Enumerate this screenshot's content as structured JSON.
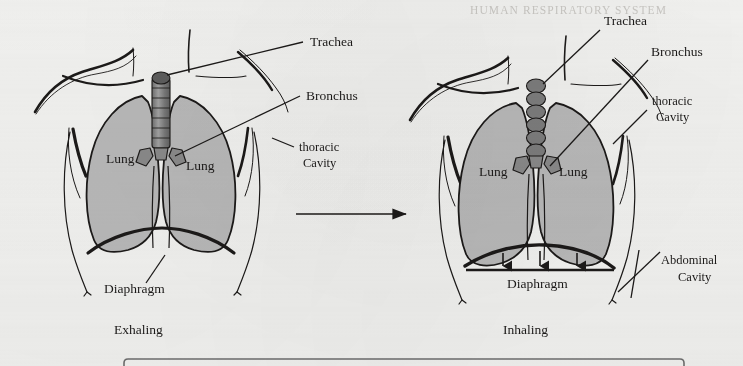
{
  "figure": {
    "background_color": "#f2f2f0",
    "ink_color": "#1c1a19",
    "lung_fill_color": "#b9b9b9",
    "trachea_fill_color": "#8a8a8a",
    "ghost_text_color": "#c9c7c3",
    "ghost_header": "HUMAN RESPIRATORY SYSTEM"
  },
  "panels": [
    {
      "id": "exhaling",
      "caption": "Exhaling",
      "organ_labels": {
        "lung_left": "Lung",
        "lung_right": "Lung",
        "diaphragm": "Diaphragm"
      },
      "callouts": [
        {
          "name": "trachea",
          "text": "Trachea"
        },
        {
          "name": "bronchus",
          "text": "Bronchus"
        },
        {
          "name": "thoracic-cavity",
          "line1": "thoracic",
          "line2": "Cavity"
        }
      ]
    },
    {
      "id": "inhaling",
      "caption": "Inhaling",
      "organ_labels": {
        "lung_left": "Lung",
        "lung_right": "Lung",
        "diaphragm": "Diaphragm"
      },
      "callouts": [
        {
          "name": "trachea",
          "text": "Trachea"
        },
        {
          "name": "bronchus",
          "text": "Bronchus"
        },
        {
          "name": "thoracic-cavity",
          "line1": "thoracic",
          "line2": "Cavity"
        },
        {
          "name": "abdominal-cavity",
          "line1": "Abdominal",
          "line2": "Cavity"
        }
      ],
      "diaphragm_motion_arrows": 3
    }
  ],
  "transition_arrow": {
    "name": "exhale-to-inhale-arrow",
    "direction": "right"
  },
  "bottom_box": {
    "name": "caption-box",
    "text": ""
  }
}
